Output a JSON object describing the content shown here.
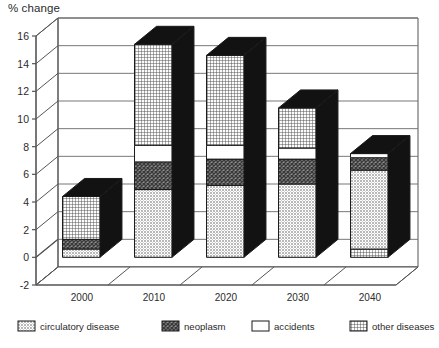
{
  "chart_data": {
    "type": "bar",
    "subtype": "stacked-3d-column",
    "title": "% change",
    "xlabel": "",
    "ylabel": "% change",
    "categories": [
      "2000",
      "2010",
      "2020",
      "2030",
      "2040"
    ],
    "ylim": [
      -2,
      16
    ],
    "yticks": [
      -2,
      0,
      2,
      4,
      6,
      8,
      10,
      12,
      14,
      16
    ],
    "ytick_labels": [
      "-2",
      "0",
      "2",
      "4",
      "6",
      "8",
      "10",
      "12",
      "14",
      "16"
    ],
    "grid": true,
    "legend_position": "bottom",
    "series": [
      {
        "name": "circulatory disease",
        "pattern": "light-stipple",
        "values": [
          0.6,
          4.9,
          5.2,
          5.3,
          5.7
        ]
      },
      {
        "name": "neoplasm",
        "pattern": "dark-crosshatch",
        "values": [
          0.7,
          2.0,
          1.9,
          1.8,
          0.9
        ]
      },
      {
        "name": "accidents",
        "pattern": "white-solid",
        "values": [
          0.0,
          1.2,
          1.0,
          0.8,
          0.3
        ]
      },
      {
        "name": "other diseases",
        "pattern": "fine-grid",
        "values": [
          3.1,
          7.3,
          6.5,
          2.9,
          0.6
        ]
      }
    ],
    "stack_order": {
      "2000": [
        "circulatory disease",
        "neoplasm",
        "accidents",
        "other diseases"
      ],
      "2010": [
        "circulatory disease",
        "neoplasm",
        "accidents",
        "other diseases"
      ],
      "2020": [
        "circulatory disease",
        "neoplasm",
        "accidents",
        "other diseases"
      ],
      "2030": [
        "circulatory disease",
        "neoplasm",
        "accidents",
        "other diseases"
      ],
      "2040": [
        "other diseases",
        "circulatory disease",
        "neoplasm",
        "accidents"
      ]
    },
    "totals": [
      4.4,
      15.4,
      14.6,
      10.8,
      7.5
    ]
  },
  "legend": {
    "items": [
      {
        "label": "circulatory disease"
      },
      {
        "label": "neoplasm"
      },
      {
        "label": "accidents"
      },
      {
        "label": "other diseases"
      }
    ]
  },
  "colors": {
    "axis": "#555555",
    "grid": "#777777",
    "bar_side": "#121212",
    "bar_outline": "#1a1a1a",
    "text": "#2b2b2b",
    "background": "#ffffff"
  }
}
